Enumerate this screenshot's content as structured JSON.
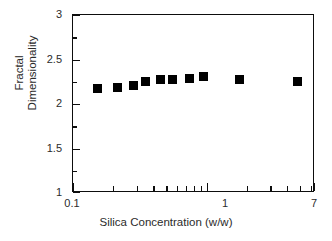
{
  "chart_data": {
    "type": "scatter",
    "title": "",
    "xlabel": "Silica Concentration (w/w)",
    "ylabel": "Fractal Dimensionality",
    "ylabel_lines": [
      "Fractal",
      "Dimensionality"
    ],
    "xscale": "log",
    "yscale": "linear",
    "xlim": [
      0.1,
      7
    ],
    "ylim": [
      1,
      3
    ],
    "grid": false,
    "legend": null,
    "marker_style": "filled-square",
    "marker_color": "#000000",
    "x_tick_labels": [
      "0.1",
      "1",
      "7"
    ],
    "x_tick_values": [
      0.1,
      1,
      7
    ],
    "y_tick_labels": [
      "1",
      "1.5",
      "2",
      "2.5",
      "3"
    ],
    "y_tick_values": [
      1,
      1.5,
      2,
      2.5,
      3
    ],
    "y_minor_tick_values": [
      1.25,
      1.75,
      2.25,
      2.75
    ],
    "x_minor_tick_values": [
      0.2,
      0.3,
      0.4,
      0.5,
      0.6,
      0.7,
      0.8,
      0.9,
      2,
      3,
      4,
      5,
      6
    ],
    "x": [
      0.155,
      0.22,
      0.29,
      0.36,
      0.47,
      0.58,
      0.78,
      1.0,
      1.9,
      5.3
    ],
    "y": [
      2.17,
      2.18,
      2.2,
      2.24,
      2.265,
      2.265,
      2.275,
      2.3,
      2.265,
      2.25
    ],
    "points": [
      {
        "x": 0.155,
        "y": 2.17
      },
      {
        "x": 0.22,
        "y": 2.18
      },
      {
        "x": 0.29,
        "y": 2.2
      },
      {
        "x": 0.36,
        "y": 2.24
      },
      {
        "x": 0.47,
        "y": 2.265
      },
      {
        "x": 0.58,
        "y": 2.265
      },
      {
        "x": 0.78,
        "y": 2.275
      },
      {
        "x": 1.0,
        "y": 2.3
      },
      {
        "x": 1.9,
        "y": 2.265
      },
      {
        "x": 5.3,
        "y": 2.25
      }
    ],
    "series": [
      {
        "name": "Fractal dimensionality",
        "x": [
          0.155,
          0.22,
          0.29,
          0.36,
          0.47,
          0.58,
          0.78,
          1.0,
          1.9,
          5.3
        ],
        "values": [
          2.17,
          2.18,
          2.2,
          2.24,
          2.265,
          2.265,
          2.275,
          2.3,
          2.265,
          2.25
        ]
      }
    ]
  },
  "axes": {
    "x_title": "Silica Concentration (w/w)",
    "y_title_line1": "Fractal",
    "y_title_line2": "Dimensionality",
    "x_labels": [
      "0.1",
      "1",
      "7"
    ],
    "y_labels": [
      "3",
      "2.5",
      "2",
      "1.5",
      "1"
    ]
  },
  "colors": {
    "axis": "#0d0d0d",
    "marker": "#000000",
    "text": "#2b2b2b",
    "background": "#ffffff"
  }
}
